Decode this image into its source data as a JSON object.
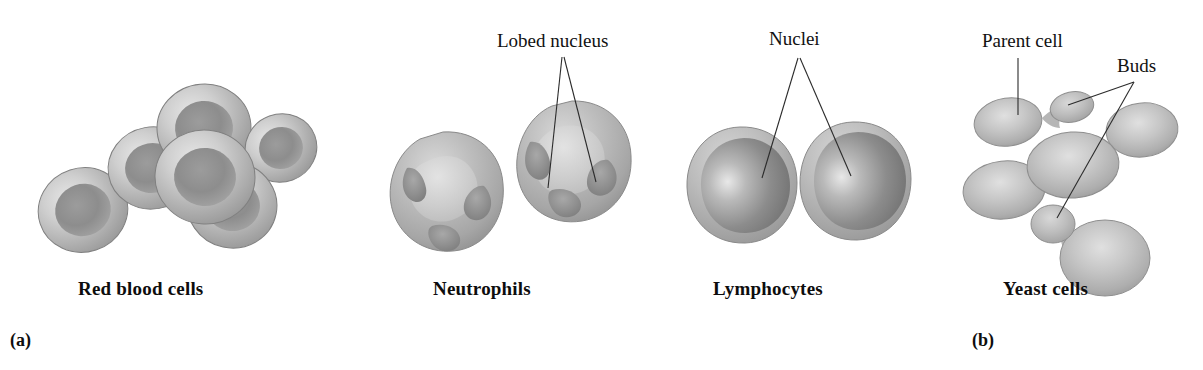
{
  "figure": {
    "background_color": "#ffffff",
    "width": 1203,
    "height": 370
  },
  "panels": [
    {
      "marker": "(a)",
      "marker_x": 10,
      "marker_y": 330,
      "captions": [
        {
          "label": "Red blood cells",
          "x": 78,
          "y": 278
        },
        {
          "label": "Neutrophils",
          "x": 433,
          "y": 278
        },
        {
          "label": "Lymphocytes",
          "x": 713,
          "y": 278
        }
      ]
    },
    {
      "marker": "(b)",
      "marker_x": 972,
      "marker_y": 330,
      "captions": [
        {
          "label": "Yeast cells",
          "x": 1003,
          "y": 278
        }
      ]
    }
  ],
  "annotations": [
    {
      "name": "lobed-nucleus",
      "label": "Lobed nucleus",
      "x": 497,
      "y": 30,
      "anchor_x": 562,
      "anchor_y": 57
    },
    {
      "name": "nuclei",
      "label": "Nuclei",
      "x": 769,
      "y": 28,
      "anchor_x": 798,
      "anchor_y": 58
    },
    {
      "name": "parent-cell",
      "label": "Parent cell",
      "x": 982,
      "y": 30,
      "anchor_x": 1018,
      "anchor_y": 58
    },
    {
      "name": "buds",
      "label": "Buds",
      "x": 1117,
      "y": 55,
      "anchor_x": 1134,
      "anchor_y": 82
    }
  ],
  "leader_lines": [
    {
      "name": "lobed-nucleus-leader-left",
      "points": "562,57 548,188"
    },
    {
      "name": "lobed-nucleus-leader-right",
      "points": "564,57 596,182"
    },
    {
      "name": "nuclei-leader-left",
      "points": "798,58 762,178"
    },
    {
      "name": "nuclei-leader-right",
      "points": "800,58 851,176"
    },
    {
      "name": "parent-cell-leader",
      "points": "1018,58 1018,115"
    },
    {
      "name": "buds-leader-upper",
      "points": "1134,82 1068,105"
    },
    {
      "name": "buds-leader-lower",
      "points": "1134,82 1057,218"
    }
  ],
  "colors": {
    "line": "#2b2b2b",
    "text": "#111111",
    "caption_text": "#0d0d0d",
    "cell_highlight": "#e2e2e2",
    "cell_mid": "#b4b4b4",
    "cell_edge": "#8d8d8d",
    "cell_outline": "#6f6f6f",
    "nucleus_highlight": "#c9c9c9",
    "nucleus_mid": "#9a9a9a",
    "nucleus_dark": "#6e6e6e",
    "rbc_center": "#8f8f8f",
    "rbc_rim": "#d4d4d4"
  },
  "cell_groups": {
    "red_blood_cells": {
      "name": "red-blood-cells",
      "description": "Biconcave discs with pale rim and darker depressed center",
      "count": 6,
      "cells": [
        {
          "cx": 83,
          "cy": 210,
          "rx": 45,
          "ry": 42,
          "rot": -18
        },
        {
          "cx": 152,
          "cy": 168,
          "rx": 44,
          "ry": 41,
          "rot": -10
        },
        {
          "cx": 205,
          "cy": 177,
          "rx": 50,
          "ry": 47,
          "rot": 5
        },
        {
          "cx": 204,
          "cy": 128,
          "rx": 47,
          "ry": 44,
          "rot": -5
        },
        {
          "cx": 232,
          "cy": 205,
          "rx": 45,
          "ry": 43,
          "rot": 12
        },
        {
          "cx": 281,
          "cy": 148,
          "rx": 36,
          "ry": 34,
          "rot": -20
        }
      ]
    },
    "neutrophils": {
      "name": "neutrophils",
      "description": "Irregular granular cells with multi-lobed darker nuclei",
      "count": 2,
      "cells": [
        {
          "cx": 443,
          "cy": 190,
          "r": 58
        },
        {
          "cx": 570,
          "cy": 160,
          "r": 58
        }
      ]
    },
    "lymphocytes": {
      "name": "lymphocytes",
      "description": "Round cells with a single large nucleus and thin cytoplasm rim",
      "count": 2,
      "cells": [
        {
          "cx": 740,
          "cy": 185,
          "r": 56
        },
        {
          "cx": 853,
          "cy": 180,
          "r": 56
        }
      ]
    },
    "yeast_cells": {
      "name": "yeast-cells",
      "description": "Smooth ovoid cells, several with attached buds",
      "count": 6,
      "cells": [
        {
          "cx": 1008,
          "cy": 122,
          "rx": 34,
          "ry": 24,
          "rot": -8,
          "type": "parent"
        },
        {
          "cx": 1072,
          "cy": 107,
          "rx": 22,
          "ry": 15,
          "rot": -12,
          "type": "bud"
        },
        {
          "cx": 1004,
          "cy": 190,
          "rx": 41,
          "ry": 29,
          "rot": -6,
          "type": "cell"
        },
        {
          "cx": 1073,
          "cy": 165,
          "rx": 46,
          "ry": 33,
          "rot": -4,
          "type": "cell"
        },
        {
          "cx": 1142,
          "cy": 130,
          "rx": 36,
          "ry": 27,
          "rot": -6,
          "type": "cell"
        },
        {
          "cx": 1053,
          "cy": 224,
          "rx": 22,
          "ry": 19,
          "rot": 0,
          "type": "bud"
        },
        {
          "cx": 1105,
          "cy": 258,
          "rx": 45,
          "ry": 38,
          "rot": 0,
          "type": "parent"
        }
      ]
    }
  }
}
